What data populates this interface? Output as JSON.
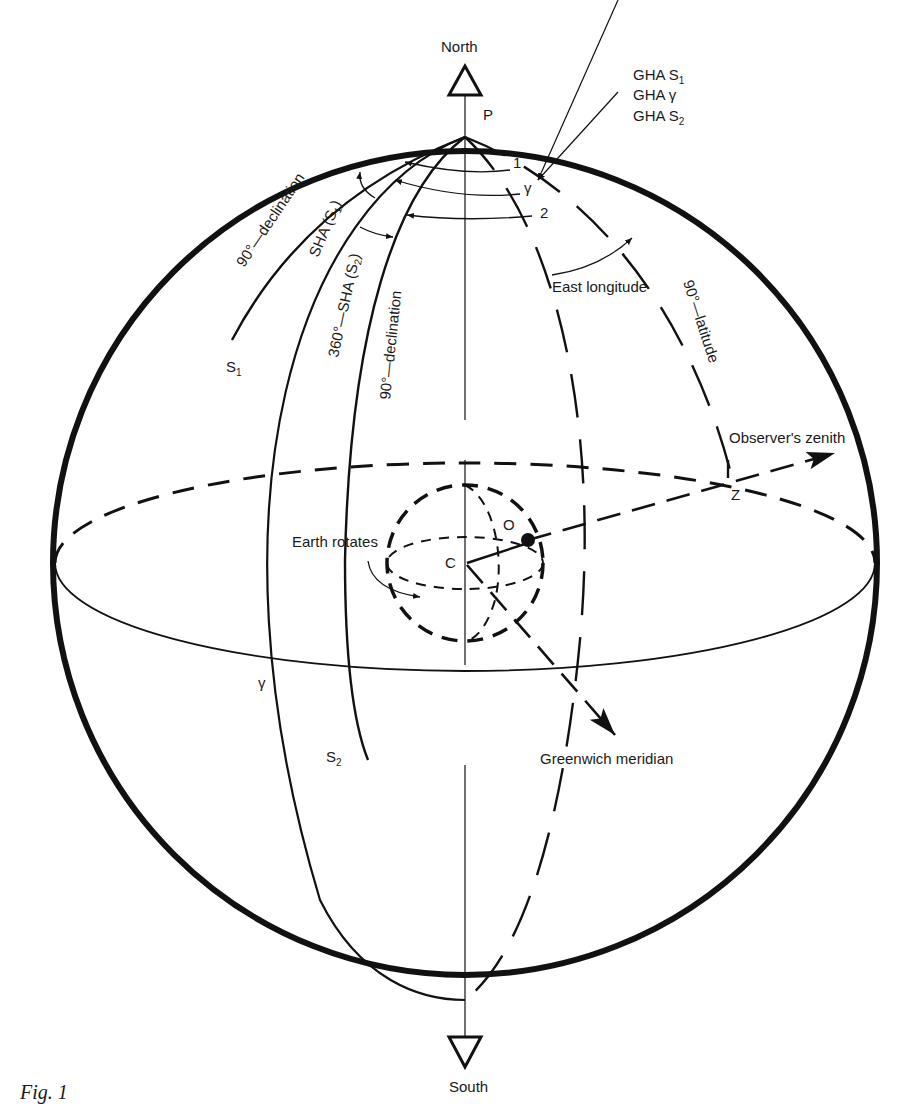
{
  "figure": {
    "caption": "Fig. 1",
    "stroke_color": "#111111",
    "background": "#ffffff"
  },
  "poles": {
    "north_label": "North",
    "south_label": "South",
    "pole_label": "P"
  },
  "gha_labels": {
    "line1": "GHA S",
    "line1_sub": "1",
    "line2": "GHA γ",
    "line3": "GHA S",
    "line3_sub": "2"
  },
  "markers": {
    "one": "1",
    "two": "2",
    "aries_top": "γ",
    "aries_equator": "γ",
    "center": "C",
    "observer": "O",
    "zenith_point": "Z"
  },
  "star_labels": {
    "s1": "S",
    "s1_sub": "1",
    "s2": "S",
    "s2_sub": "2"
  },
  "arc_labels": {
    "declination_s1": "90°—declination",
    "sha_s1": "SHA (S",
    "sha_s1_sub": "1",
    "sha_s1_close": ")",
    "sha_s2": "360°—SHA (S",
    "sha_s2_sub": "2",
    "sha_s2_close": ")",
    "declination_s2": "90°—declination",
    "east_longitude": "East longitude",
    "colatitude": "90°—latitude"
  },
  "callouts": {
    "observers_zenith": "Observer's zenith",
    "earth_rotates": "Earth rotates",
    "greenwich_meridian": "Greenwich meridian"
  }
}
